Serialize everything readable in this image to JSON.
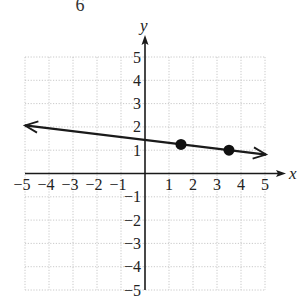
{
  "header_fragment": "6",
  "chart_data": {
    "type": "line",
    "title": "",
    "xlabel": "x",
    "ylabel": "y",
    "xlim": [
      -5,
      5
    ],
    "ylim": [
      -5,
      5
    ],
    "grid": true,
    "grid_style": "dotted",
    "x_ticks": [
      -5,
      -4,
      -3,
      -2,
      -1,
      1,
      2,
      3,
      4,
      5
    ],
    "y_ticks": [
      -5,
      -4,
      -3,
      -2,
      -1,
      1,
      2,
      3,
      4,
      5
    ],
    "x_tick_labels": [
      "−5",
      "−4",
      "−3",
      "−2",
      "−1",
      "1",
      "2",
      "3",
      "4",
      "5"
    ],
    "y_tick_labels": [
      "−5",
      "−4",
      "−3",
      "−2",
      "−1",
      "1",
      "2",
      "3",
      "4",
      "5"
    ],
    "points": [
      {
        "x": 1.5,
        "y": 1.25
      },
      {
        "x": 3.5,
        "y": 1
      }
    ],
    "line": {
      "slope": -0.125,
      "intercept": 1.4375,
      "x_start": -5,
      "x_end": 5,
      "arrows": "both"
    },
    "colors": {
      "line": "#1a1a1a",
      "grid": "#bbbbbb",
      "axis": "#1a1a1a",
      "points": "#111111"
    }
  }
}
